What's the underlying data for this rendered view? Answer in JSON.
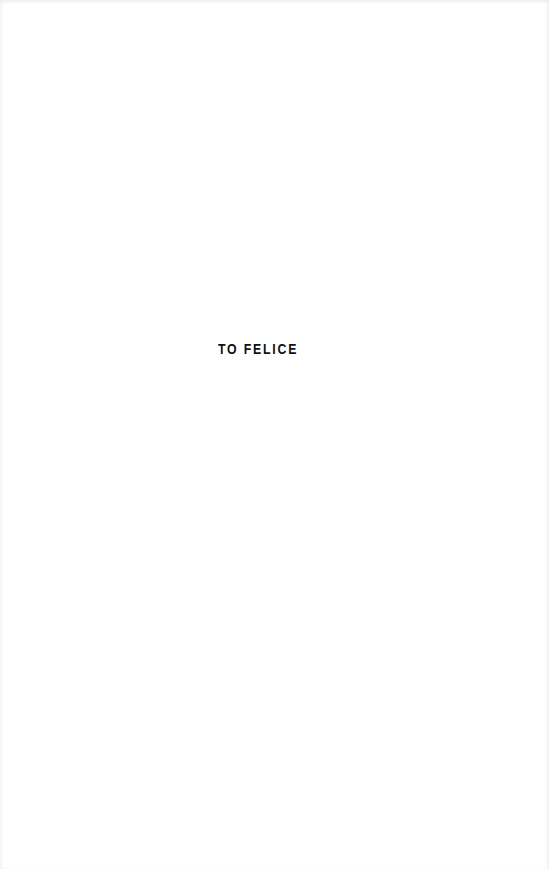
{
  "page": {
    "type": "dedication",
    "dedication_text": "TO FELICE",
    "text_color": "#111111",
    "background_color": "#ffffff"
  }
}
